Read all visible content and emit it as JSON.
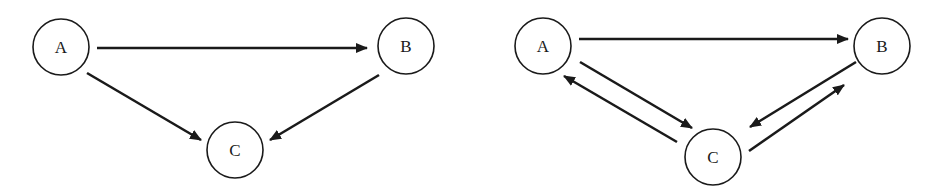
{
  "diagrams": [
    {
      "name": "graph-left",
      "nodes": [
        {
          "id": "A",
          "label": "A",
          "cx": 61,
          "cy": 47
        },
        {
          "id": "B",
          "label": "B",
          "cx": 406,
          "cy": 46
        },
        {
          "id": "C",
          "label": "C",
          "cx": 235,
          "cy": 150
        }
      ],
      "edges": [
        {
          "from": "A",
          "to": "B",
          "x1": 97,
          "y1": 48,
          "x2": 367,
          "y2": 48
        },
        {
          "from": "A",
          "to": "C",
          "x1": 87,
          "y1": 73,
          "x2": 201,
          "y2": 140
        },
        {
          "from": "B",
          "to": "C",
          "x1": 379,
          "y1": 75,
          "x2": 270,
          "y2": 140
        }
      ]
    },
    {
      "name": "graph-right",
      "nodes": [
        {
          "id": "A",
          "label": "A",
          "cx": 543,
          "cy": 46
        },
        {
          "id": "B",
          "label": "B",
          "cx": 882,
          "cy": 46
        },
        {
          "id": "C",
          "label": "C",
          "cx": 713,
          "cy": 157
        }
      ],
      "edges": [
        {
          "from": "A",
          "to": "B",
          "x1": 579,
          "y1": 39,
          "x2": 848,
          "y2": 39
        },
        {
          "from": "A",
          "to": "C",
          "x1": 580,
          "y1": 62,
          "x2": 692,
          "y2": 128
        },
        {
          "from": "C",
          "to": "A",
          "x1": 677,
          "y1": 142,
          "x2": 564,
          "y2": 76
        },
        {
          "from": "B",
          "to": "C",
          "x1": 856,
          "y1": 62,
          "x2": 750,
          "y2": 127
        },
        {
          "from": "C",
          "to": "B",
          "x1": 749,
          "y1": 151,
          "x2": 844,
          "y2": 85
        }
      ]
    }
  ],
  "node_radius": 28
}
